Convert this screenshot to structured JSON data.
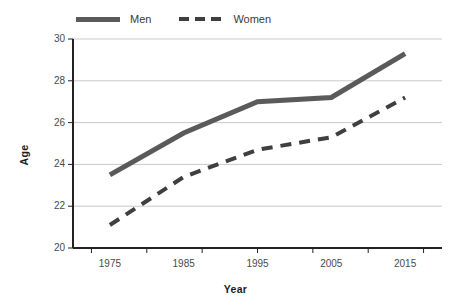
{
  "chart_data": {
    "type": "line",
    "title": "",
    "xlabel": "Year",
    "ylabel": "Age",
    "x": [
      1975,
      1985,
      1995,
      2005,
      2015
    ],
    "categories": [
      "1975",
      "1985",
      "1995",
      "2005",
      "2015"
    ],
    "xlim": [
      1970,
      2020
    ],
    "ylim": [
      20,
      30
    ],
    "y_ticks": [
      20,
      22,
      24,
      26,
      28,
      30
    ],
    "x_ticks": [
      1975,
      1985,
      1995,
      2005,
      2015
    ],
    "grid": "horizontal",
    "legend_position": "top",
    "series": [
      {
        "name": "Men",
        "values": [
          23.5,
          25.5,
          27.0,
          27.2,
          29.3
        ],
        "style": "solid",
        "color": "#5a5a5a",
        "width": 5
      },
      {
        "name": "Women",
        "values": [
          21.1,
          23.4,
          24.7,
          25.3,
          27.2
        ],
        "style": "dashed",
        "color": "#3f3f3f",
        "width": 4
      }
    ]
  },
  "legend": {
    "entries": [
      {
        "label": "Men",
        "swatch": "solid-line-swatch"
      },
      {
        "label": "Women",
        "swatch": "dashed-line-swatch"
      }
    ]
  },
  "axes": {
    "y_title": "Age",
    "x_title": "Year",
    "y_tick_labels": [
      "30",
      "28",
      "26",
      "24",
      "22",
      "20"
    ],
    "x_tick_labels": [
      "1975",
      "1985",
      "1995",
      "2005",
      "2015"
    ]
  },
  "colors": {
    "men_line": "#5a5a5a",
    "women_line": "#3f3f3f",
    "gridline": "#c9c9c9",
    "axis": "#222222",
    "text": "#3a3a3a",
    "background": "#ffffff"
  }
}
